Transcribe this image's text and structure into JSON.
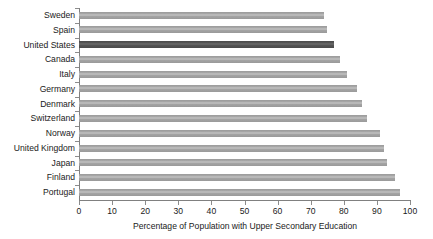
{
  "chart_data": {
    "type": "bar",
    "orientation": "horizontal",
    "title": "",
    "xlabel": "Percentage of Population with Upper Secondary Education",
    "ylabel": "",
    "xlim": [
      0,
      100
    ],
    "xticks": [
      0,
      10,
      20,
      30,
      40,
      50,
      60,
      70,
      80,
      90,
      100
    ],
    "grid": false,
    "legend": false,
    "categories": [
      "Sweden",
      "Spain",
      "United States",
      "Canada",
      "Italy",
      "Germany",
      "Denmark",
      "Switzerland",
      "Norway",
      "United Kingdom",
      "Japan",
      "Finland",
      "Portugal"
    ],
    "values": [
      74,
      75,
      77,
      79,
      81,
      84,
      85.5,
      87,
      91,
      92,
      93,
      95.5,
      97
    ],
    "highlight_category": "United States",
    "colors": {
      "bar": "#a9a9a9",
      "bar_highlight": "#555555",
      "axis": "#808080",
      "text": "#1a1a1a",
      "background": "#ffffff"
    }
  }
}
